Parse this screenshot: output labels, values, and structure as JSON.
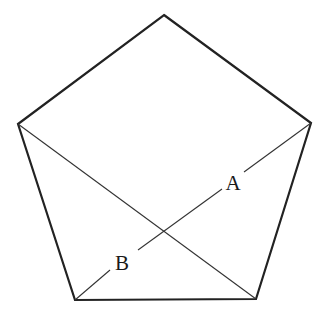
{
  "diagram": {
    "type": "regular-pentagon-with-diagonals",
    "stroke_color": "#222222",
    "background": "#ffffff",
    "vertices": {
      "top": [
        164,
        15
      ],
      "left": [
        18,
        124
      ],
      "right": [
        311,
        123
      ],
      "bottom_left": [
        75,
        300
      ],
      "bottom_right": [
        256,
        299
      ]
    },
    "diagonals": [
      {
        "from": "left",
        "to": "bottom_right"
      },
      {
        "from": "right",
        "to": "bottom_left"
      }
    ],
    "labels": [
      {
        "text": "A",
        "x": 233,
        "y": 190
      },
      {
        "text": "B",
        "x": 122,
        "y": 270
      }
    ]
  }
}
